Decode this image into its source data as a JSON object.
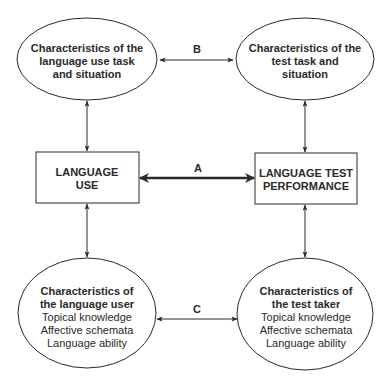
{
  "diagram": {
    "nodes": {
      "language_use_task": {
        "shape": "ellipse",
        "lines": [
          "Characteristics of the",
          "language use task",
          "and situation"
        ]
      },
      "test_task": {
        "shape": "ellipse",
        "lines": [
          "Characteristics of the",
          "test task and",
          "situation"
        ]
      },
      "language_use": {
        "shape": "rectangle",
        "lines": [
          "LANGUAGE",
          "USE"
        ]
      },
      "test_performance": {
        "shape": "rectangle",
        "lines": [
          "LANGUAGE TEST",
          "PERFORMANCE"
        ]
      },
      "language_user": {
        "shape": "ellipse",
        "title_lines": [
          "Characteristics of",
          "the language user"
        ],
        "items": [
          "Topical knowledge",
          "Affective schemata",
          "Language ability"
        ]
      },
      "test_taker": {
        "shape": "ellipse",
        "title_lines": [
          "Characteristics of",
          "the test taker"
        ],
        "items": [
          "Topical knowledge",
          "Affective schemata",
          "Language ability"
        ]
      }
    },
    "edges": [
      {
        "from": "language_use_task",
        "to": "test_task",
        "label": "B",
        "style": "thin",
        "bidirectional": true
      },
      {
        "from": "language_use",
        "to": "test_performance",
        "label": "A",
        "style": "bold",
        "bidirectional": true
      },
      {
        "from": "language_user",
        "to": "test_taker",
        "label": "C",
        "style": "thin",
        "bidirectional": true
      },
      {
        "from": "language_use_task",
        "to": "language_use",
        "label": "",
        "style": "thin",
        "bidirectional": true
      },
      {
        "from": "test_task",
        "to": "test_performance",
        "label": "",
        "style": "thin",
        "bidirectional": true
      },
      {
        "from": "language_use",
        "to": "language_user",
        "label": "",
        "style": "thin",
        "bidirectional": true
      },
      {
        "from": "test_performance",
        "to": "test_taker",
        "label": "",
        "style": "thin",
        "bidirectional": true
      }
    ],
    "labels": {
      "a": "A",
      "b": "B",
      "c": "C"
    },
    "colors": {
      "stroke": "#2a2a2a",
      "text": "#2a2a2a",
      "background": "#ffffff"
    }
  }
}
